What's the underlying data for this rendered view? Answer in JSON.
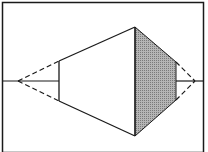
{
  "diagram": {
    "type": "perspective-frustum",
    "colors": {
      "line": "#1a1a1a",
      "shade": "#9a9a9a",
      "background": "#ffffff"
    },
    "frame": {
      "x": 2,
      "y": 2,
      "w": 202,
      "h": 150
    },
    "axis_y": 81,
    "left_apex": [
      18,
      81
    ],
    "right_apex": [
      195,
      81
    ],
    "small_face": {
      "x": 59,
      "top": 61,
      "bottom": 101
    },
    "large_face": {
      "x": 135,
      "top": 27,
      "bottom": 136
    },
    "shaded_face": {
      "x": 176,
      "top": 62,
      "bottom": 100
    }
  }
}
